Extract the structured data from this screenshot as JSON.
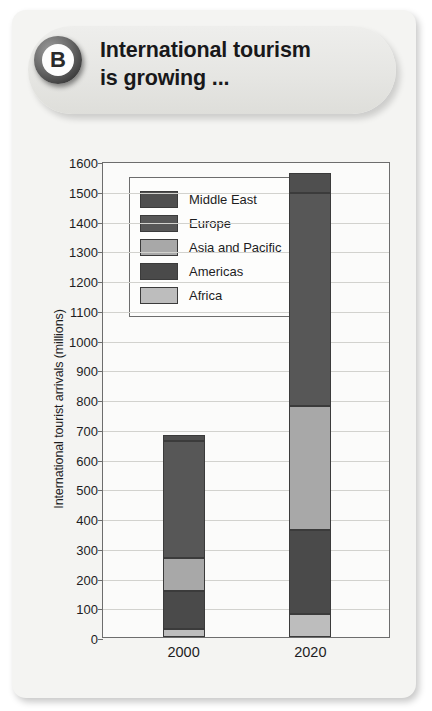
{
  "card": {
    "badge_letter": "B",
    "heading_line1": "International tourism",
    "heading_line2": "is growing ..."
  },
  "colors": {
    "middle_east": "#4f4f4f",
    "europe": "#575757",
    "asia_pacific": "#a8a8a8",
    "americas": "#4a4a4a",
    "africa": "#bdbdbd",
    "axis": "#6d6d6d",
    "grid": "#d2d2ce",
    "plot_background": "#fbfbfa",
    "text": "#1d1d1f"
  },
  "chart_data": {
    "type": "bar",
    "stacked": true,
    "title": "",
    "xlabel": "",
    "ylabel": "International tourist arrivals (millions)",
    "categories": [
      "2000",
      "2020"
    ],
    "ylim": [
      0,
      1600
    ],
    "ytick_step": 100,
    "ytick_labels": [
      "0",
      "100",
      "200",
      "300",
      "400",
      "500",
      "600",
      "700",
      "800",
      "900",
      "1000",
      "1100",
      "1200",
      "1300",
      "1400",
      "1500",
      "1600"
    ],
    "grid": true,
    "legend_position": "upper-left-inside",
    "series": [
      {
        "name": "Africa",
        "color_key": "africa",
        "values": [
          27,
          77
        ]
      },
      {
        "name": "Americas",
        "color_key": "americas",
        "values": [
          128,
          282
        ]
      },
      {
        "name": "Asia and Pacific",
        "color_key": "asia_pacific",
        "values": [
          110,
          416
        ]
      },
      {
        "name": "Europe",
        "color_key": "europe",
        "values": [
          393,
          718
        ]
      },
      {
        "name": "Middle East",
        "color_key": "middle_east",
        "values": [
          22,
          67
        ]
      }
    ],
    "totals": [
      680,
      1560
    ],
    "legend_order": [
      "Middle East",
      "Europe",
      "Asia and Pacific",
      "Americas",
      "Africa"
    ]
  }
}
